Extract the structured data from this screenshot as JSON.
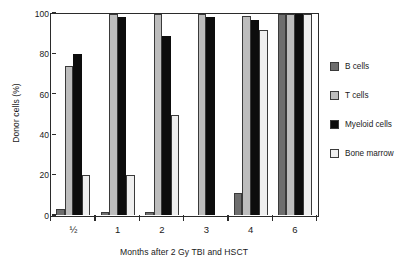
{
  "chart_data": {
    "type": "bar",
    "title": "",
    "xlabel": "Months after 2 Gy TBI and HSCT",
    "ylabel": "Donor cells (%)",
    "categories": [
      "½",
      "1",
      "2",
      "3",
      "4",
      "6"
    ],
    "ylim": [
      0,
      100
    ],
    "yticks": [
      0,
      20,
      40,
      60,
      80,
      100
    ],
    "ytick_labels": [
      "0",
      "20",
      "40",
      "60",
      "80",
      "100"
    ],
    "grid": false,
    "legend_position": "right",
    "series": [
      {
        "name": "B cells",
        "color": "#6e6e6e",
        "values": [
          3,
          1.5,
          1.5,
          0,
          11,
          100
        ]
      },
      {
        "name": "T cells",
        "color": "#bdbdbd",
        "values": [
          74,
          100,
          100,
          100,
          99,
          100
        ]
      },
      {
        "name": "Myeloid cells",
        "color": "#0d0d0d",
        "values": [
          80,
          98.5,
          89,
          98.5,
          97,
          100
        ]
      },
      {
        "name": "Bone marrow",
        "color": "#efefef",
        "values": [
          20,
          20,
          50,
          0,
          92,
          100
        ]
      }
    ]
  },
  "legend": {
    "items": [
      {
        "label": "B cells",
        "color": "#6e6e6e"
      },
      {
        "label": "T cells",
        "color": "#bdbdbd"
      },
      {
        "label": "Myeloid cells",
        "color": "#0d0d0d"
      },
      {
        "label": "Bone marrow",
        "color": "#efefef"
      }
    ]
  }
}
